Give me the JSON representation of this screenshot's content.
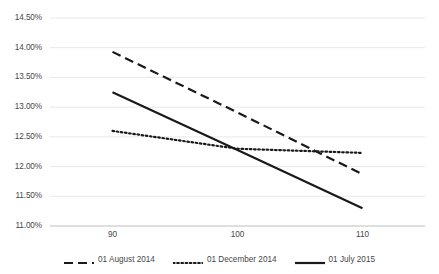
{
  "chart_data": {
    "type": "line",
    "title": "",
    "subtitle": "",
    "xlabel": "",
    "ylabel": "",
    "x": [
      90,
      100,
      110
    ],
    "xlim": [
      85,
      115
    ],
    "ylim": [
      11.0,
      14.5
    ],
    "xticks": [
      90,
      100,
      110
    ],
    "xtick_labels": [
      "90",
      "100",
      "110"
    ],
    "yticks": [
      11.0,
      11.5,
      12.0,
      12.5,
      13.0,
      13.5,
      14.0,
      14.5
    ],
    "ytick_labels": [
      "11.00%",
      "11.50%",
      "12.00%",
      "12.50%",
      "13.00%",
      "13.50%",
      "14.00%",
      "14.50%"
    ],
    "grid": "horizontal",
    "legend_position": "bottom",
    "series": [
      {
        "name": "01 August 2014",
        "style": "dashed",
        "color": "#1a1a1a",
        "values": [
          13.93,
          12.91,
          11.87
        ]
      },
      {
        "name": "01 December 2014",
        "style": "dotted",
        "color": "#1a1a1a",
        "values": [
          12.6,
          12.3,
          12.23
        ]
      },
      {
        "name": "01 July 2015",
        "style": "solid",
        "color": "#1a1a1a",
        "values": [
          13.25,
          12.28,
          11.3
        ]
      }
    ]
  },
  "axis": {
    "axis_line_color": "#bfbfbf",
    "grid_color": "#e8e8e8"
  },
  "legend": {
    "entries": [
      {
        "label": "01 August 2014",
        "style": "dashed"
      },
      {
        "label": "01 December 2014",
        "style": "dotted"
      },
      {
        "label": "01 July 2015",
        "style": "solid"
      }
    ]
  }
}
